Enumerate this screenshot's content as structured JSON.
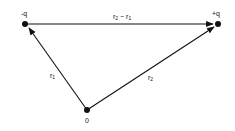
{
  "diagram": {
    "points": {
      "neg_charge": {
        "label": "-q",
        "x": 25,
        "y": 24
      },
      "pos_charge": {
        "label": "+q",
        "x": 218,
        "y": 24
      },
      "origin": {
        "label": "0",
        "x": 87,
        "y": 110
      }
    },
    "vectors": {
      "r1": {
        "base": "r",
        "sub": "1"
      },
      "r2": {
        "base": "r",
        "sub": "2"
      },
      "diff": {
        "a": "r",
        "a_sub": "2",
        "op": " − ",
        "b": "r",
        "b_sub": "1"
      }
    },
    "colors": {
      "stroke": "#111111",
      "background": "#ffffff"
    }
  }
}
